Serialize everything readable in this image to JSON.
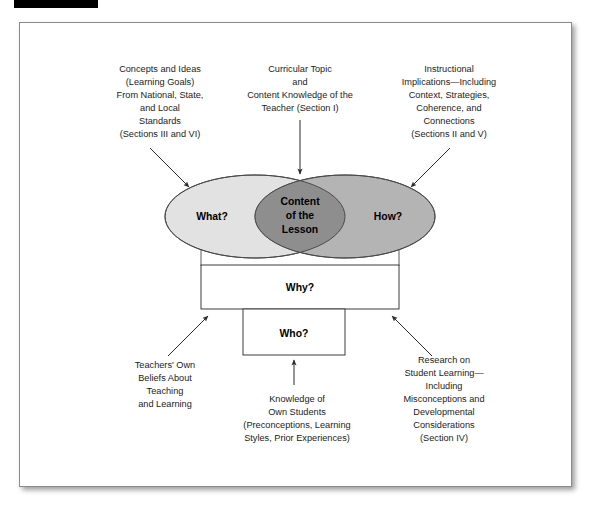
{
  "figure": {
    "title_bar": "",
    "frame_border_color": "#8a8a8a",
    "background_color": "#ffffff"
  },
  "colors": {
    "ellipse_left_fill": "#e2e2e2",
    "ellipse_right_fill": "#b4b4b4",
    "overlap_fill": "#8e8e8e",
    "ellipse_stroke": "#4a4a4a",
    "line_color": "#2a2a2a",
    "text_color": "#1b1b1b"
  },
  "venn": {
    "left": {
      "label": "What?",
      "caption_lines": [
        "Concepts and Ideas",
        "(Learning Goals)",
        "From National, State,",
        "and Local",
        "Standards",
        "(Sections III and VI)"
      ]
    },
    "center": {
      "label_lines": [
        "Content",
        "of the",
        "Lesson"
      ],
      "caption_lines": [
        "Curricular Topic",
        "and",
        "Content Knowledge of the",
        "Teacher (Section I)"
      ]
    },
    "right": {
      "label": "How?",
      "caption_lines": [
        "Instructional",
        "Implications—Including",
        "Context, Strategies,",
        "Coherence, and",
        "Connections",
        "(Sections II and V)"
      ]
    }
  },
  "boxes": {
    "why": {
      "label": "Why?"
    },
    "who": {
      "label": "Who?"
    }
  },
  "bottom_captions": {
    "left": {
      "lines": [
        "Teachers' Own",
        "Beliefs About",
        "Teaching",
        "and Learning"
      ]
    },
    "center": {
      "lines": [
        "Knowledge of",
        "Own Students",
        "(Preconceptions, Learning",
        "Styles, Prior Experiences)"
      ]
    },
    "right": {
      "lines": [
        "Research on",
        "Student Learning—",
        "Including",
        "Misconceptions and",
        "Developmental",
        "Considerations",
        "(Section IV)"
      ]
    }
  }
}
